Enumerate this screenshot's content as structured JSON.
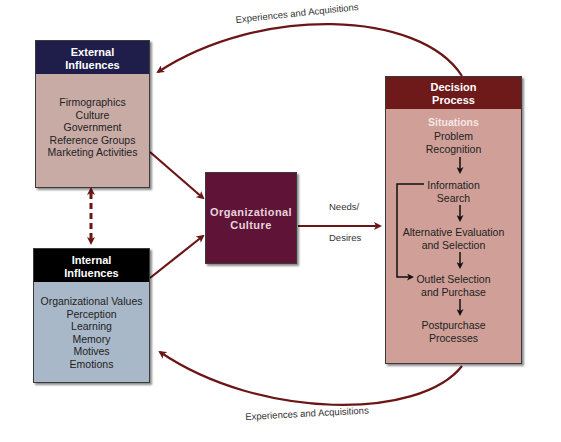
{
  "external_influences": {
    "title_line1": "External",
    "title_line2": "Influences",
    "items": [
      "Firmographics",
      "Culture",
      "Government",
      "Reference Groups",
      "Marketing Activities"
    ],
    "header_color": "#1f1d4a",
    "body_color": "#c9aba6"
  },
  "internal_influences": {
    "title_line1": "Internal",
    "title_line2": "Influences",
    "items": [
      "Organizational Values",
      "Perception",
      "Learning",
      "Memory",
      "Motives",
      "Emotions"
    ],
    "header_color": "#000000",
    "body_color": "#a9b8c8"
  },
  "organizational_culture": {
    "title_line1": "Organizational",
    "title_line2": "Culture",
    "color": "#5e1337"
  },
  "needs_desires": {
    "line1": "Needs/",
    "line2": "Desires"
  },
  "decision_process": {
    "title_line1": "Decision",
    "title_line2": "Process",
    "situations": "Situations",
    "steps": [
      {
        "line1": "Problem",
        "line2": "Recognition"
      },
      {
        "line1": "Information",
        "line2": "Search"
      },
      {
        "line1": "Alternative Evaluation",
        "line2": "and Selection"
      },
      {
        "line1": "Outlet Selection",
        "line2": "and Purchase"
      },
      {
        "line1": "Postpurchase",
        "line2": "Processes"
      }
    ],
    "header_color": "#6e1a1a",
    "body_color": "#cf9f98"
  },
  "feedback_loops": {
    "top_label": "Experiences and Acquisitions",
    "bottom_label": "Experiences and Acquisitions",
    "arrow_color": "#6b1616"
  }
}
